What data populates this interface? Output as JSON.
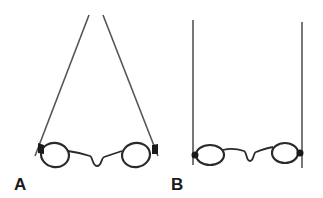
{
  "figure": {
    "panels": [
      {
        "id": "A",
        "label": "A",
        "description": "Spectacles with temples angled inward, converging toward the top"
      },
      {
        "id": "B",
        "label": "B",
        "description": "Spectacles with straight parallel vertical temples"
      }
    ],
    "colors": {
      "background": "#ffffff",
      "line": "#2a2a2a",
      "temple": "#555555"
    }
  }
}
